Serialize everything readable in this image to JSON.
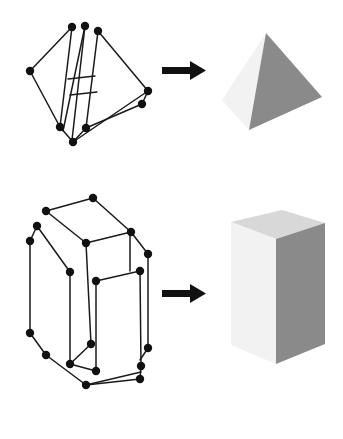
{
  "figure": {
    "background": "#ffffff",
    "width": 343,
    "height": 439,
    "rows": [
      {
        "id": "row-tetrahedron",
        "label": "Tetrahedron example",
        "wireframe_label": "tetrahedron-wireframe",
        "arrow_label": "arrow-right",
        "solid_label": "tetrahedron-solid"
      },
      {
        "id": "row-box",
        "label": "Rectangular box example",
        "wireframe_label": "box-wireframe",
        "arrow_label": "arrow-right",
        "solid_label": "box-solid"
      }
    ]
  },
  "colors": {
    "ink": "#111111",
    "line": "#1a1a1a",
    "face_light": "#f2f2f2",
    "face_mid": "#d8d8d8",
    "face_dark": "#8a8a8a",
    "face_dark_edge": "#7e7e7e",
    "background": "#ffffff"
  },
  "chart_data": {
    "type": "diagram",
    "panels": [
      {
        "name": "tetrahedron-wireframe",
        "kind": "wireframe",
        "nodes": [
          {
            "id": "t1",
            "x": 72,
            "y": 27
          },
          {
            "id": "t2",
            "x": 85,
            "y": 26
          },
          {
            "id": "t3",
            "x": 98,
            "y": 31
          },
          {
            "id": "t4",
            "x": 30,
            "y": 71
          },
          {
            "id": "t5",
            "x": 148,
            "y": 91
          },
          {
            "id": "t6",
            "x": 142,
            "y": 104
          },
          {
            "id": "t7",
            "x": 60,
            "y": 127
          },
          {
            "id": "t8",
            "x": 86,
            "y": 128
          },
          {
            "id": "t9",
            "x": 73,
            "y": 142
          }
        ],
        "edges": [
          [
            "t1",
            "t4"
          ],
          [
            "t4",
            "t7"
          ],
          [
            "t7",
            "t9"
          ],
          [
            "t9",
            "t8"
          ],
          [
            "t3",
            "t5"
          ],
          [
            "t5",
            "t9"
          ],
          [
            "t8",
            "t6"
          ],
          [
            "t6",
            "t5"
          ],
          [
            "t1",
            "t7"
          ],
          [
            "t2",
            "t8"
          ],
          [
            "t2",
            "t7"
          ],
          [
            "t3",
            "t8"
          ]
        ],
        "rungs": [
          {
            "x1": 68,
            "y1": 79,
            "x2": 96,
            "y2": 76
          },
          {
            "x1": 70,
            "y1": 94,
            "x2": 98,
            "y2": 91
          }
        ]
      },
      {
        "name": "tetrahedron-solid",
        "kind": "shaded-solid",
        "faces": [
          {
            "id": "left-face",
            "fill": "#f2f2f2",
            "points": "266,33 222,100 249,130"
          },
          {
            "id": "right-face",
            "fill": "#8a8a8a",
            "points": "266,33 249,130 322,97"
          }
        ]
      },
      {
        "name": "box-wireframe",
        "kind": "wireframe",
        "nodes": [
          {
            "id": "b1",
            "x": 93,
            "y": 198
          },
          {
            "id": "b2",
            "x": 46,
            "y": 211
          },
          {
            "id": "b3",
            "x": 131,
            "y": 232
          },
          {
            "id": "b4",
            "x": 37,
            "y": 226
          },
          {
            "id": "b5",
            "x": 86,
            "y": 243
          },
          {
            "id": "b6",
            "x": 30,
            "y": 241
          },
          {
            "id": "b7",
            "x": 148,
            "y": 254
          },
          {
            "id": "b8",
            "x": 70,
            "y": 272
          },
          {
            "id": "b9",
            "x": 140,
            "y": 271
          },
          {
            "id": "b10",
            "x": 96,
            "y": 281
          },
          {
            "id": "b11",
            "x": 30,
            "y": 333
          },
          {
            "id": "b12",
            "x": 91,
            "y": 344
          },
          {
            "id": "b13",
            "x": 46,
            "y": 355
          },
          {
            "id": "b14",
            "x": 148,
            "y": 348
          },
          {
            "id": "b15",
            "x": 70,
            "y": 364
          },
          {
            "id": "b16",
            "x": 96,
            "y": 371
          },
          {
            "id": "b17",
            "x": 141,
            "y": 366
          },
          {
            "id": "b18",
            "x": 140,
            "y": 379
          },
          {
            "id": "b19",
            "x": 86,
            "y": 385
          }
        ],
        "edges": [
          [
            "b1",
            "b2"
          ],
          [
            "b1",
            "b3"
          ],
          [
            "b2",
            "b5"
          ],
          [
            "b3",
            "b7"
          ],
          [
            "b5",
            "b3"
          ],
          [
            "b4",
            "b6"
          ],
          [
            "b4",
            "b8"
          ],
          [
            "b6",
            "b11"
          ],
          [
            "b5",
            "b12"
          ],
          [
            "b8",
            "b15"
          ],
          [
            "b11",
            "b13"
          ],
          [
            "b13",
            "b19"
          ],
          [
            "b19",
            "b16"
          ],
          [
            "b16",
            "b12"
          ],
          [
            "b12",
            "b15"
          ],
          [
            "b10",
            "b16"
          ],
          [
            "b7",
            "b14"
          ],
          [
            "b9",
            "b10"
          ],
          [
            "b9",
            "b17"
          ],
          [
            "b14",
            "b18"
          ],
          [
            "b17",
            "b18"
          ],
          [
            "b18",
            "b19"
          ]
        ]
      },
      {
        "name": "box-solid",
        "kind": "shaded-solid",
        "faces": [
          {
            "id": "top-face",
            "fill": "#d8d8d8",
            "points": "231,222 282,210 325,223 276,239"
          },
          {
            "id": "left-face",
            "fill": "#f2f2f2",
            "points": "231,222 276,239 276,364 231,345"
          },
          {
            "id": "right-face",
            "fill": "#8a8a8a",
            "points": "276,239 325,223 325,344 276,364"
          }
        ]
      }
    ],
    "arrows": [
      {
        "name": "arrow-right-top",
        "x": 162,
        "y": 70,
        "length": 42,
        "thickness": 7
      },
      {
        "name": "arrow-right-bottom",
        "x": 162,
        "y": 293,
        "length": 42,
        "thickness": 7
      }
    ]
  }
}
